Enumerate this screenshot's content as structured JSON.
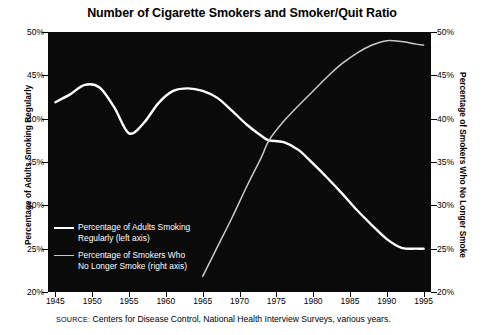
{
  "chart_data": {
    "type": "line",
    "title": "Number of Cigarette Smokers and Smoker/Quit Ratio",
    "xlabel": "",
    "ylabel": "Percentage of Adults Smoking Regularly",
    "ylabel_right": "Percentage of Smokers Who No Longer Smoke",
    "xlim": [
      1944,
      1996
    ],
    "ylim": [
      20,
      50
    ],
    "ylim_right": [
      20,
      50
    ],
    "ytick_labels": [
      "50%",
      "45%",
      "40%",
      "35%",
      "30%",
      "25%",
      "20%"
    ],
    "ytick_values": [
      50,
      45,
      40,
      35,
      30,
      25,
      20
    ],
    "ytick_labels_right": [
      "50%",
      "45%",
      "40%",
      "35%",
      "30%",
      "25%",
      "20%"
    ],
    "xtick_labels": [
      "1945",
      "1950",
      "1955",
      "1960",
      "1965",
      "1970",
      "1975",
      "1980",
      "1985",
      "1990",
      "1995"
    ],
    "xtick_values": [
      1945,
      1950,
      1955,
      1960,
      1965,
      1970,
      1975,
      1980,
      1985,
      1990,
      1995
    ],
    "grid": false,
    "plot_background": "#0a0a0a",
    "legend_position": "inside-lower-left",
    "series": [
      {
        "name": "Percentage of Adults Smoking\nRegularly (left axis)",
        "axis": "left",
        "color": "#ffffff",
        "width": 2.4,
        "x": [
          1945,
          1947,
          1949,
          1951,
          1953,
          1955,
          1957,
          1959,
          1961,
          1963,
          1965,
          1967,
          1969,
          1971,
          1973,
          1974,
          1976,
          1978,
          1980,
          1982,
          1984,
          1986,
          1988,
          1990,
          1992,
          1994,
          1995
        ],
        "values": [
          41.9,
          42.8,
          43.9,
          43.6,
          41.3,
          38.3,
          39.5,
          41.8,
          43.2,
          43.5,
          43.2,
          42.4,
          40.9,
          39.3,
          38.0,
          37.5,
          37.3,
          36.4,
          34.8,
          33.1,
          31.3,
          29.4,
          27.7,
          26.1,
          25.1,
          25.0,
          25.0
        ]
      },
      {
        "name": "Percentage of Smokers Who\nNo Longer Smoke (right axis)",
        "axis": "right",
        "color": "#c9c9c9",
        "width": 1.5,
        "x": [
          1965,
          1967,
          1969,
          1971,
          1973,
          1974,
          1976,
          1978,
          1980,
          1982,
          1984,
          1986,
          1988,
          1990,
          1992,
          1994,
          1995
        ],
        "values": [
          21.8,
          25.2,
          28.6,
          32.2,
          35.6,
          37.5,
          39.7,
          41.5,
          43.2,
          44.9,
          46.4,
          47.6,
          48.5,
          49.0,
          48.9,
          48.6,
          48.5
        ]
      }
    ]
  },
  "legend": {
    "entries": [
      {
        "label": "Percentage of Adults Smoking\nRegularly (left axis)",
        "style": "thick"
      },
      {
        "label": "Percentage of Smokers Who\nNo Longer Smoke (right axis)",
        "style": "thin"
      }
    ]
  },
  "source": {
    "label": "SOURCE:",
    "text": " Centers for Disease Control, National Health Interview Surveys, various years."
  }
}
